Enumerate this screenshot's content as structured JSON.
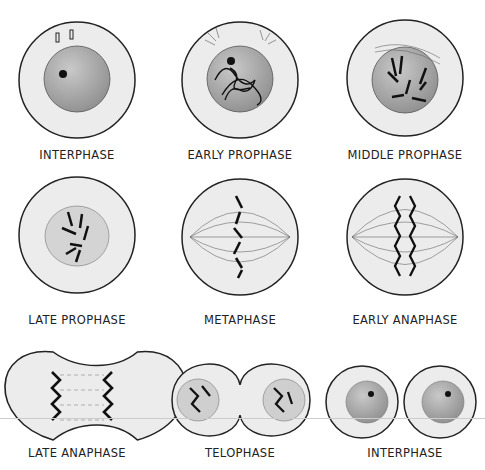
{
  "diagram": {
    "stages": [
      {
        "label": "INTERPHASE"
      },
      {
        "label": "EARLY PROPHASE"
      },
      {
        "label": "MIDDLE PROPHASE"
      },
      {
        "label": "LATE PROPHASE"
      },
      {
        "label": "METAPHASE"
      },
      {
        "label": "EARLY ANAPHASE"
      },
      {
        "label": "LATE ANAPHASE"
      },
      {
        "label": "TELOPHASE"
      },
      {
        "label": "INTERPHASE"
      }
    ]
  },
  "colors": {
    "cell": "#ececec",
    "nucleus": "#b5b5b5",
    "outline": "#222222",
    "chromosome": "#1a1a1a"
  }
}
